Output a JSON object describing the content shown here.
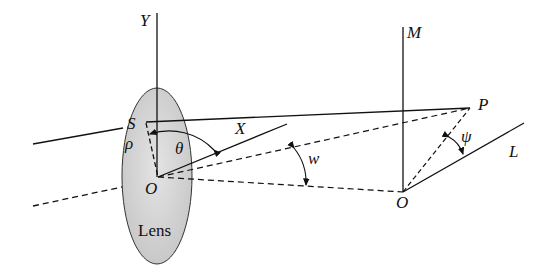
{
  "labels": {
    "Y": "Y",
    "S": "S",
    "rho": "ρ",
    "theta": "θ",
    "X": "X",
    "O_lens": "O",
    "lens": "Lens",
    "w": "w",
    "M": "M",
    "P": "P",
    "psi": "ψ",
    "L": "L",
    "O_image": "O"
  },
  "colors": {
    "lens_fill": "#d4d4d4",
    "line": "#111111"
  }
}
